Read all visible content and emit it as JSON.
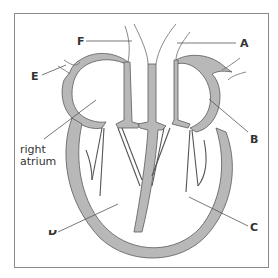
{
  "diagram": {
    "colors": {
      "muscle_fill": "#b8b8b8",
      "outline": "#5a5a5a",
      "leader_line": "#555555",
      "frame": "#8a8a8a",
      "label_text": "#333333"
    },
    "labels": [
      {
        "id": "A",
        "text": "A",
        "points_to": "aorta wall / pulmonary vessel (top right)"
      },
      {
        "id": "B",
        "text": "B",
        "points_to": "left atrium"
      },
      {
        "id": "C",
        "text": "C",
        "points_to": "left ventricle wall"
      },
      {
        "id": "D",
        "text": "D",
        "points_to": "right ventricle",
        "note": "label partially cut off"
      },
      {
        "id": "E",
        "text": "E",
        "points_to": "vena cava (upper left vessel)"
      },
      {
        "id": "F",
        "text": "F",
        "points_to": "pulmonary artery (top)"
      },
      {
        "id": "right_atrium",
        "text_line1": "right",
        "text_line2": "atrium"
      }
    ]
  }
}
